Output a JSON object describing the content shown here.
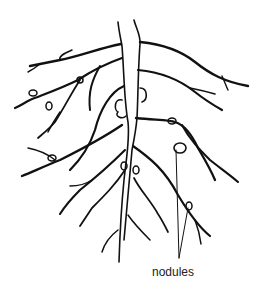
{
  "diagram": {
    "labels": {
      "nodules": "nodules"
    },
    "colors": {
      "stroke": "#111111",
      "background": "#ffffff"
    }
  }
}
